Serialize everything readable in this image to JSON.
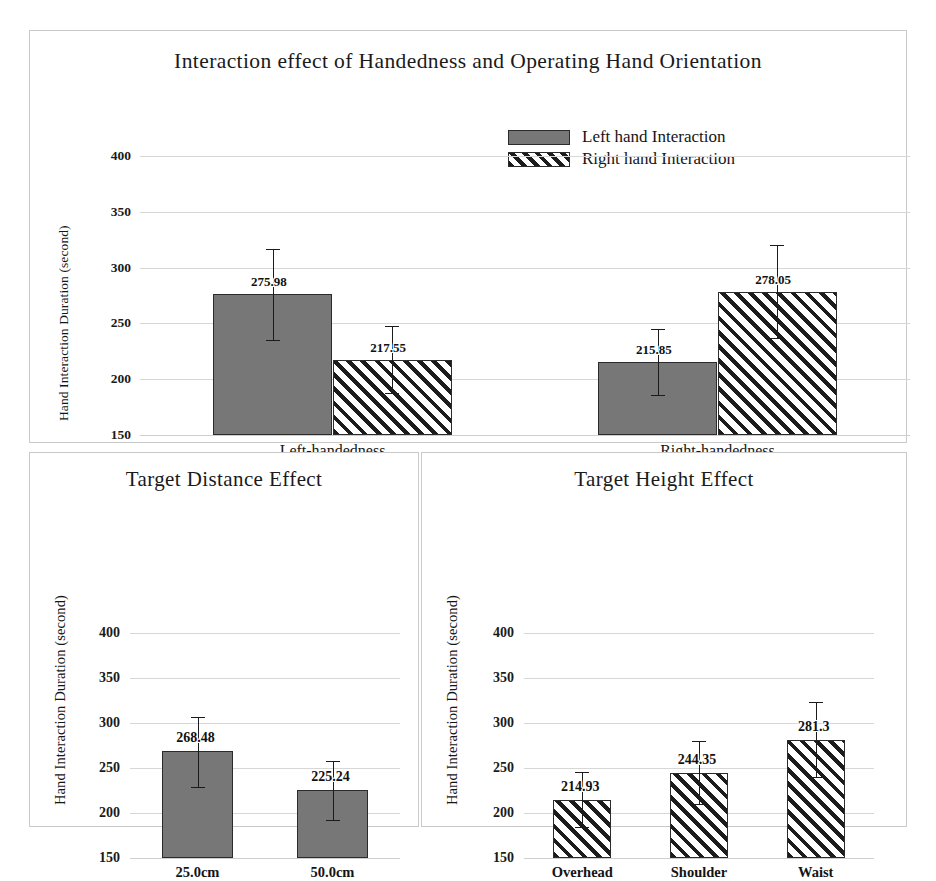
{
  "figure": {
    "panels": [
      {
        "id": "top",
        "title": "Interaction effect of Handedness and Operating Hand Orientation",
        "ylabel": "Hand Interaction Duration (second)"
      },
      {
        "id": "bottom_left",
        "title": "Target Distance Effect",
        "ylabel": "Hand Interaction Duration (second)"
      },
      {
        "id": "bottom_right",
        "title": "Target Height Effect",
        "ylabel": "Hand Interaction Duration (second)"
      }
    ]
  },
  "chart_data": [
    {
      "id": "top",
      "type": "bar",
      "title": "Interaction effect of Handedness and Operating Hand Orientation",
      "xlabel": "",
      "ylabel": "Hand Interaction Duration (second)",
      "ylim": [
        150,
        400
      ],
      "yticks": [
        150,
        200,
        250,
        300,
        350,
        400
      ],
      "grid": true,
      "legend_position": "top-center",
      "categories": [
        "Left-handedness",
        "Right-handedness"
      ],
      "series": [
        {
          "name": "Left hand Interaction",
          "fill": "solid-gray",
          "values": [
            275.98,
            215.85
          ],
          "value_labels": [
            "275.98",
            "215.85"
          ],
          "error_low": [
            235,
            186
          ],
          "error_high": [
            317,
            245
          ]
        },
        {
          "name": "Right hand Interaction",
          "fill": "diagonal-hatch",
          "values": [
            217.55,
            278.05
          ],
          "value_labels": [
            "217.55",
            "278.05"
          ],
          "error_low": [
            188,
            237
          ],
          "error_high": [
            248,
            320
          ]
        }
      ]
    },
    {
      "id": "bottom_left",
      "type": "bar",
      "title": "Target Distance Effect",
      "xlabel": "",
      "ylabel": "Hand Interaction Duration (second)",
      "ylim": [
        150,
        400
      ],
      "yticks": [
        150,
        200,
        250,
        300,
        350,
        400
      ],
      "grid": true,
      "categories": [
        "25.0cm",
        "50.0cm"
      ],
      "series": [
        {
          "name": "Target Distance",
          "fill": "solid-gray",
          "values": [
            268.48,
            225.24
          ],
          "value_labels": [
            "268.48",
            "225.24"
          ],
          "error_low": [
            229,
            192
          ],
          "error_high": [
            307,
            258
          ]
        }
      ]
    },
    {
      "id": "bottom_right",
      "type": "bar",
      "title": "Target Height Effect",
      "xlabel": "",
      "ylabel": "Hand Interaction Duration (second)",
      "ylim": [
        150,
        400
      ],
      "yticks": [
        150,
        200,
        250,
        300,
        350,
        400
      ],
      "grid": true,
      "categories": [
        "Overhead",
        "Shoulder",
        "Waist"
      ],
      "series": [
        {
          "name": "Target Height",
          "fill": "diagonal-hatch",
          "values": [
            214.93,
            244.35,
            281.3
          ],
          "value_labels": [
            "214.93",
            "244.35",
            "281.3"
          ],
          "error_low": [
            185,
            210,
            240
          ],
          "error_high": [
            246,
            280,
            323
          ]
        }
      ]
    }
  ],
  "legend": {
    "items": [
      {
        "label": "Left hand Interaction",
        "fill": "solid-gray"
      },
      {
        "label": "Right hand Interaction",
        "fill": "diagonal-hatch"
      }
    ]
  },
  "colors": {
    "bar_gray": "#777777",
    "bar_outline": "#2b2b2b",
    "hatch_line": "#1c1c1c",
    "gridline": "#d7d7d7",
    "panel_border": "#c9c9c9",
    "text": "#111111",
    "background": "#ffffff"
  }
}
